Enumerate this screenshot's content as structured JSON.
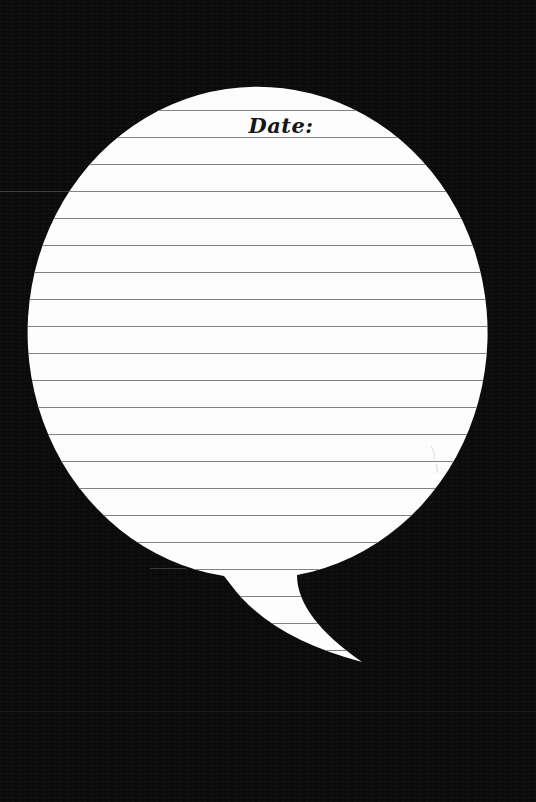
{
  "page": {
    "background_color": "#0a0a0a",
    "date_label": "Date:",
    "date_value": ""
  },
  "bubble": {
    "fill": "#fdfdfd",
    "rule_color": "#828282",
    "rules": {
      "count": 21,
      "start_y": 110.5,
      "spacing": 27.0
    },
    "text_color": "#161616"
  },
  "artifacts": {
    "ghost_line_color": "#7d7d7d"
  }
}
